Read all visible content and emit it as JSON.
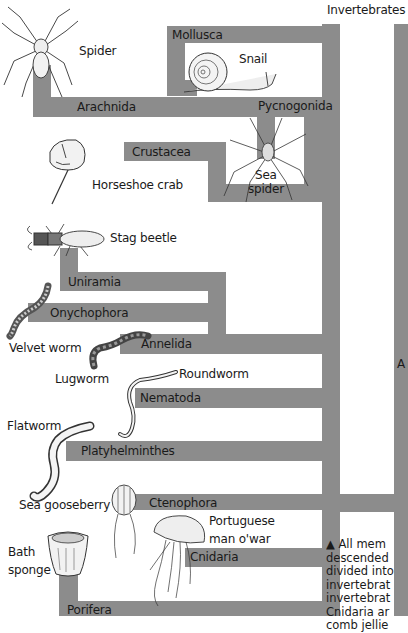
{
  "title": "Invertebrates",
  "cut_label": "A",
  "groups": [
    {
      "name": "Arachnida",
      "example": "Spider"
    },
    {
      "name": "Mollusca",
      "example": "Snail"
    },
    {
      "name": "Pycnogonida",
      "example": "Sea spider"
    },
    {
      "name": "Crustacea",
      "example": "Horseshoe crab"
    },
    {
      "name": "Uniramia",
      "example": "Stag beetle"
    },
    {
      "name": "Onychophora",
      "example": "Velvet worm"
    },
    {
      "name": "Annelida",
      "example": "Lugworm"
    },
    {
      "name": "Nematoda",
      "example": "Roundworm"
    },
    {
      "name": "Platyhelminthes",
      "example": "Flatworm"
    },
    {
      "name": "Ctenophora",
      "example": "Sea gooseberry"
    },
    {
      "name": "Cnidaria",
      "example": "Portuguese man o'war"
    },
    {
      "name": "Porifera",
      "example": "Bath sponge"
    }
  ],
  "labels": {
    "sea_spider_line1": "Sea",
    "sea_spider_line2": "spider",
    "pmow_line1": "Portuguese",
    "pmow_line2": "man o'war",
    "bath_line1": "Bath",
    "bath_line2": "sponge"
  },
  "caption_lines": [
    "▲ All mem",
    "descended",
    "divided into",
    "invertebrat",
    "invertebrat",
    "Cnidaria ar",
    "comb jellie"
  ],
  "colors": {
    "branch": "#8c8c8c",
    "text": "#1a1a1a",
    "background": "#ffffff"
  }
}
